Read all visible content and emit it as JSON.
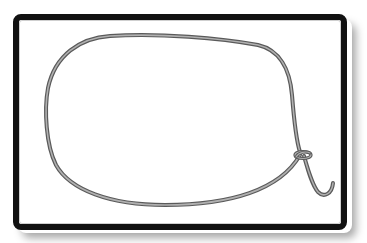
{
  "illustration": {
    "subject": "rope-loop-with-slip-knot",
    "frame": {
      "border_color": "#111111",
      "background": "#ffffff",
      "shadow": true
    },
    "rope": {
      "outer_color": "#5a5a5a",
      "inner_color": "#a8a8a8",
      "has_knot": true,
      "has_hooked_tail": true
    }
  }
}
